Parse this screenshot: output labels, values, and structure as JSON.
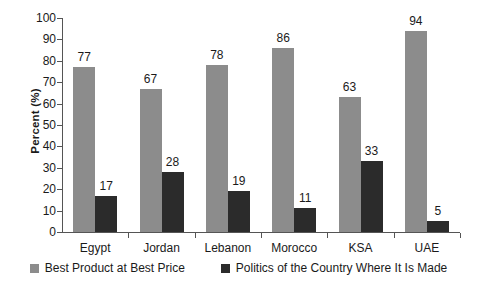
{
  "chart_data": {
    "type": "bar",
    "title": "",
    "subtitle": "",
    "xlabel": "",
    "ylabel": "Percent (%)",
    "ylim": [
      0,
      100
    ],
    "ytick_step": 10,
    "yticks": [
      100,
      90,
      80,
      70,
      60,
      50,
      40,
      30,
      20,
      10,
      0
    ],
    "grid": false,
    "legend_position": "bottom",
    "categories": [
      "Egypt",
      "Jordan",
      "Lebanon",
      "Morocco",
      "KSA",
      "UAE"
    ],
    "series": [
      {
        "name": "Best Product at Best Price",
        "color": "#8c8c8c",
        "values": [
          77,
          67,
          78,
          86,
          63,
          94
        ]
      },
      {
        "name": "Politics of the Country Where It Is Made",
        "color": "#2b2b2b",
        "values": [
          17,
          28,
          19,
          11,
          33,
          5
        ]
      }
    ]
  },
  "legend": {
    "items": [
      {
        "label": "Best Product at Best Price",
        "color": "#8c8c8c"
      },
      {
        "label": "Politics of the Country Where It Is Made",
        "color": "#2b2b2b"
      }
    ]
  },
  "axis": {
    "y_title": "Percent (%)"
  },
  "colors": {
    "series_light": "#8c8c8c",
    "series_dark": "#2b2b2b",
    "axis": "#555555",
    "text": "#1a1a1a",
    "background": "#ffffff"
  }
}
